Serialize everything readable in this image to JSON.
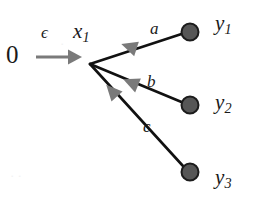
{
  "figure": {
    "type": "state-transition-diagram",
    "width": 254,
    "height": 201,
    "background_color": "#ffffff"
  },
  "colors": {
    "edge_stroke": "#111111",
    "arrowhead_fill": "#7a7a7a",
    "node_fill": "#565656",
    "node_stroke": "#1c1c1c",
    "text": "#1a1a1a",
    "input_arrow": "#7a7a7a"
  },
  "source": {
    "label": "0",
    "name": "source-zero"
  },
  "input_edge": {
    "label": "ϵ",
    "label_name": "epsilon",
    "from": "0",
    "to": "x1",
    "direction": "right",
    "x1": 36,
    "y1": 57,
    "x2": 78,
    "y2": 57
  },
  "state": {
    "label": "x",
    "subscript": "1",
    "junction_x": 90,
    "junction_y": 64
  },
  "nodes": [
    {
      "id": "y1",
      "label": "y",
      "subscript": "1",
      "cx": 190,
      "cy": 32,
      "r": 8.5
    },
    {
      "id": "y2",
      "label": "y",
      "subscript": "2",
      "cx": 190,
      "cy": 105,
      "r": 8.5
    },
    {
      "id": "y3",
      "label": "y",
      "subscript": "3",
      "cx": 190,
      "cy": 172,
      "r": 8.5
    }
  ],
  "edges": [
    {
      "id": "edge-a",
      "label": "a",
      "from": "y1",
      "to": "x1",
      "x1": 181.5,
      "y1": 34,
      "x2": 90,
      "y2": 64,
      "arrow_t": 0.64
    },
    {
      "id": "edge-b",
      "label": "b",
      "from": "y2",
      "to": "x1",
      "x1": 181.5,
      "y1": 102,
      "x2": 90,
      "y2": 64,
      "arrow_t": 0.62
    },
    {
      "id": "edge-c",
      "label": "c",
      "from": "y3",
      "to": "x1",
      "x1": 183,
      "y1": 166,
      "x2": 90,
      "y2": 64,
      "arrow_t": 0.7
    }
  ],
  "artifacts": {
    "scan_noise_1": "· ·",
    "scan_noise_2": "·"
  }
}
